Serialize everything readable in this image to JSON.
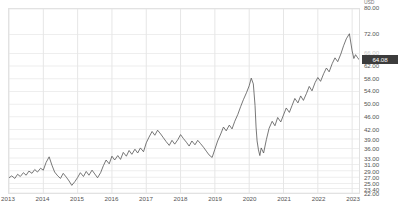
{
  "chart_data": {
    "type": "line",
    "title": "",
    "xlabel": "",
    "ylabel": "",
    "currency": "USD",
    "last_value": 64.08,
    "ylim": [
      22.0,
      80.0
    ],
    "xlim": [
      2013.0,
      2023.2
    ],
    "grid": true,
    "legend": null,
    "line_color": "#555555",
    "ytick_labels": [
      "80.00",
      "72.00",
      "66.00",
      "62.00",
      "58.00",
      "54.00",
      "50.00",
      "46.00",
      "42.00",
      "39.00",
      "36.00",
      "33.00",
      "31.00",
      "29.00",
      "27.00",
      "25.00",
      "23.40",
      "22.00"
    ],
    "ytick_values": [
      80.0,
      72.0,
      66.0,
      62.0,
      58.0,
      54.0,
      50.0,
      46.0,
      42.0,
      39.0,
      36.0,
      33.0,
      31.0,
      29.0,
      27.0,
      25.0,
      23.4,
      22.0
    ],
    "ytick_faded": [
      false,
      false,
      true,
      false,
      false,
      false,
      false,
      false,
      false,
      false,
      false,
      false,
      false,
      false,
      false,
      false,
      false,
      false
    ],
    "xtick_labels": [
      "2013",
      "2014",
      "2015",
      "2016",
      "2017",
      "2018",
      "2019",
      "2020",
      "2021",
      "2022",
      "2023"
    ],
    "xtick_values": [
      2013,
      2014,
      2015,
      2016,
      2017,
      2018,
      2019,
      2020,
      2021,
      2022,
      2023
    ],
    "series": [
      {
        "name": "price",
        "x": [
          2013.0,
          2013.08,
          2013.17,
          2013.25,
          2013.33,
          2013.42,
          2013.5,
          2013.58,
          2013.67,
          2013.75,
          2013.83,
          2013.92,
          2014.0,
          2014.08,
          2014.17,
          2014.25,
          2014.33,
          2014.42,
          2014.5,
          2014.58,
          2014.67,
          2014.75,
          2014.83,
          2014.92,
          2015.0,
          2015.08,
          2015.17,
          2015.25,
          2015.33,
          2015.42,
          2015.5,
          2015.58,
          2015.67,
          2015.75,
          2015.83,
          2015.92,
          2016.0,
          2016.08,
          2016.17,
          2016.25,
          2016.33,
          2016.42,
          2016.5,
          2016.58,
          2016.67,
          2016.75,
          2016.83,
          2016.92,
          2017.0,
          2017.08,
          2017.17,
          2017.25,
          2017.33,
          2017.42,
          2017.5,
          2017.58,
          2017.67,
          2017.75,
          2017.83,
          2017.92,
          2018.0,
          2018.08,
          2018.17,
          2018.25,
          2018.33,
          2018.42,
          2018.5,
          2018.58,
          2018.67,
          2018.75,
          2018.83,
          2018.92,
          2019.0,
          2019.08,
          2019.17,
          2019.25,
          2019.33,
          2019.42,
          2019.5,
          2019.58,
          2019.67,
          2019.75,
          2019.83,
          2019.92,
          2020.0,
          2020.06,
          2020.12,
          2020.17,
          2020.2,
          2020.23,
          2020.27,
          2020.31,
          2020.35,
          2020.42,
          2020.5,
          2020.58,
          2020.67,
          2020.75,
          2020.83,
          2020.92,
          2021.0,
          2021.08,
          2021.17,
          2021.25,
          2021.33,
          2021.42,
          2021.5,
          2021.58,
          2021.67,
          2021.75,
          2021.83,
          2021.92,
          2022.0,
          2022.08,
          2022.17,
          2022.25,
          2022.33,
          2022.42,
          2022.5,
          2022.58,
          2022.67,
          2022.75,
          2022.83,
          2022.92,
          2023.0,
          2023.05,
          2023.1,
          2023.15,
          2023.2
        ],
        "y": [
          26.8,
          27.4,
          26.6,
          27.9,
          27.2,
          28.4,
          27.6,
          28.9,
          28.2,
          29.4,
          28.6,
          29.8,
          29.2,
          31.6,
          33.4,
          30.8,
          28.6,
          27.4,
          26.6,
          28.2,
          27.0,
          25.8,
          24.4,
          25.6,
          26.9,
          28.4,
          27.2,
          28.8,
          27.6,
          29.2,
          28.0,
          26.8,
          28.4,
          30.6,
          32.4,
          31.2,
          33.6,
          32.4,
          33.8,
          32.6,
          34.8,
          33.6,
          35.4,
          34.2,
          35.8,
          34.6,
          36.2,
          35.0,
          37.8,
          39.6,
          41.4,
          40.2,
          41.8,
          40.6,
          39.4,
          38.2,
          37.0,
          38.6,
          37.4,
          38.8,
          40.4,
          39.2,
          38.0,
          36.8,
          38.4,
          37.2,
          38.6,
          37.6,
          36.4,
          35.2,
          34.0,
          33.2,
          35.8,
          38.4,
          40.6,
          42.8,
          41.6,
          43.4,
          42.2,
          44.6,
          46.8,
          49.2,
          51.4,
          53.6,
          55.8,
          58.2,
          56.4,
          49.6,
          42.8,
          38.4,
          35.6,
          33.8,
          36.2,
          34.6,
          38.8,
          42.4,
          44.6,
          43.2,
          45.8,
          44.4,
          46.6,
          48.8,
          47.4,
          49.6,
          51.8,
          50.4,
          52.6,
          51.2,
          53.4,
          55.6,
          54.2,
          56.8,
          58.4,
          57.2,
          59.6,
          61.4,
          60.2,
          62.8,
          64.6,
          63.4,
          65.8,
          68.4,
          70.6,
          72.2,
          66.8,
          64.4,
          65.6,
          64.8,
          64.08
        ]
      }
    ]
  },
  "y_axis": {
    "currency_label": "USD",
    "last_price_label": "64.08"
  }
}
